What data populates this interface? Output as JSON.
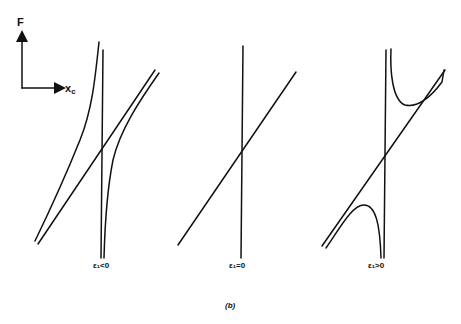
{
  "axes": {
    "y_label": "F",
    "x_label": "x",
    "x_label_sub": "c"
  },
  "panels": [
    {
      "id": "negative",
      "label": "ε₁<0",
      "case": "avoided crossing, curves bend apart horizontally"
    },
    {
      "id": "zero",
      "label": "ε₁=0",
      "case": "lines cross"
    },
    {
      "id": "positive",
      "label": "ε₁>0",
      "case": "avoided crossing, curves bend apart vertically"
    }
  ],
  "caption": "(b)"
}
